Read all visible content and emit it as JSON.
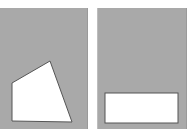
{
  "figure": {
    "background": "#ffffff",
    "panel_color": "#a9a9a9",
    "shape_fill": "#ffffff",
    "shape_stroke": "#555555",
    "panels": [
      {
        "name": "left",
        "shape": "quadrilateral",
        "points": "50,61 12,83 12,121 72,122"
      },
      {
        "name": "right",
        "shape": "rectangle",
        "x": 105,
        "y": 93,
        "width": 73,
        "height": 30
      }
    ]
  }
}
